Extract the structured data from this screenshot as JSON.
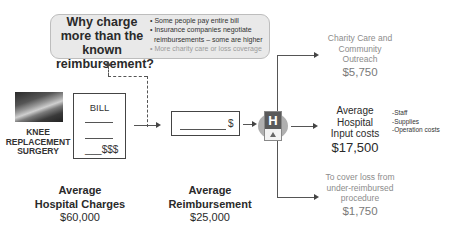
{
  "callout": {
    "title": "Why charge more than the known reimbursement?",
    "reasons": [
      "• Some people pay entire bill",
      "• Insurance companies negotiate",
      "  reimbursements – some are higher",
      "• More charity care or loss coverage"
    ]
  },
  "procedure": {
    "label_lines": [
      "KNEE",
      "REPLACEMENT",
      "SURGERY"
    ],
    "image_icon": "knee-xray-image"
  },
  "bill": {
    "title": "BILL",
    "amount_placeholder": "___$$$"
  },
  "charges": {
    "label_line1": "Average",
    "label_line2": "Hospital Charges",
    "amount": "$60,000"
  },
  "reimbursement_box": {
    "dollar": "$"
  },
  "reimbursement": {
    "label_line1": "Average",
    "label_line2": "Reimbursement",
    "amount": "$25,000"
  },
  "hospital_icon": {
    "letter": "H",
    "icon": "hospital-sign-icon"
  },
  "outcomes": {
    "charity": {
      "lines": [
        "Charity Care and",
        "Community",
        "Outreach"
      ],
      "amount": "$5,750"
    },
    "input_costs": {
      "lines": [
        "Average",
        "Hospital",
        "Input costs"
      ],
      "amount": "$17,500",
      "items": [
        "-Staff",
        "-Supplies",
        "-Operation costs"
      ]
    },
    "loss": {
      "lines": [
        "To cover loss from",
        "under-reimbursed",
        "procedure"
      ],
      "amount": "$1,750"
    }
  },
  "colors": {
    "callout_bg": "#e9e9e9",
    "grey_text": "#8c8c8c",
    "dark_text": "#2a2a2a",
    "hospital_sign": "#5a5a5a"
  }
}
